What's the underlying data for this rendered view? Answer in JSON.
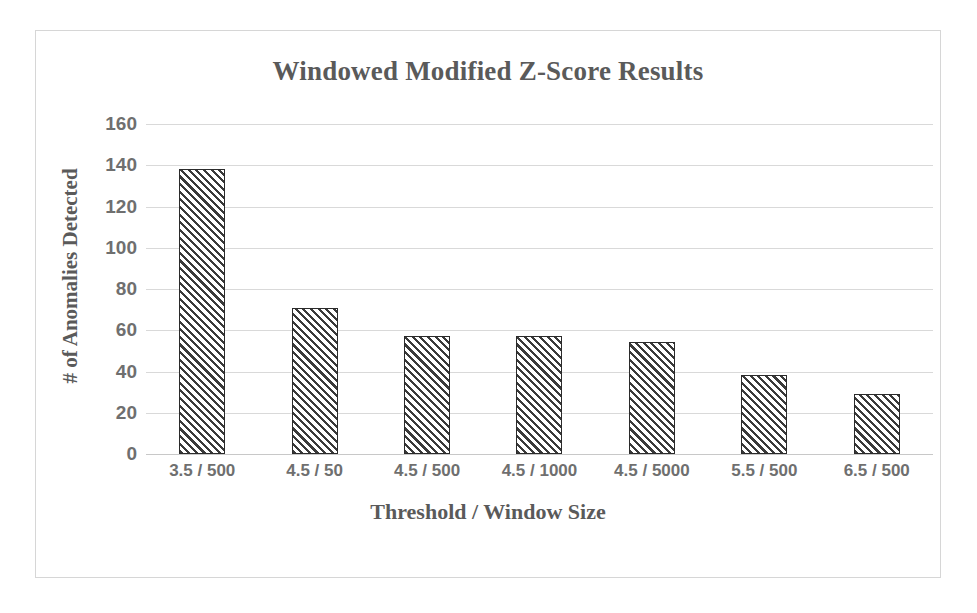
{
  "chart_data": {
    "type": "bar",
    "title": "Windowed Modified Z-Score Results",
    "xlabel": "Threshold / Window Size",
    "ylabel": "# of Anomalies Detected",
    "categories": [
      "3.5 / 500",
      "4.5 / 50",
      "4.5 / 500",
      "4.5 / 1000",
      "4.5 / 5000",
      "5.5 / 500",
      "6.5 / 500"
    ],
    "values": [
      138,
      71,
      57,
      57,
      54.5,
      38.5,
      29
    ],
    "ylim": [
      0,
      160
    ],
    "ytick_values": [
      0,
      20,
      40,
      60,
      80,
      100,
      120,
      140,
      160
    ],
    "ytick_labels": [
      "0",
      "20",
      "40",
      "60",
      "80",
      "100",
      "120",
      "140",
      "160"
    ],
    "grid": "horizontal",
    "legend": "none",
    "series": [
      {
        "name": "# of Anomalies Detected",
        "values": [
          138,
          71,
          57,
          57,
          54.5,
          38.5,
          29
        ],
        "fill": "diagonal-hatch",
        "border_color": "#2b2b2b",
        "hatch_color": "#3a3a3a"
      }
    ],
    "colors": {
      "title_text": "#5a5a5a",
      "axis_text": "#6f6f6f",
      "gridline": "#d9d9d9",
      "frame_border": "#d6d6d6",
      "background": "#ffffff"
    }
  }
}
